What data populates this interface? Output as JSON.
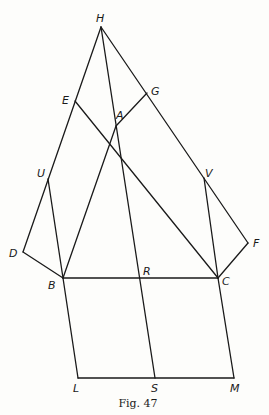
{
  "figure": {
    "caption": "Fig. 47",
    "points": {
      "H": {
        "label": "H",
        "x": 101,
        "y": 27,
        "lx": 96,
        "ly": 22
      },
      "E": {
        "label": "E",
        "x": 75,
        "y": 101,
        "lx": 62,
        "ly": 104
      },
      "G": {
        "label": "G",
        "x": 147,
        "y": 93,
        "lx": 151,
        "ly": 95
      },
      "A": {
        "label": "A",
        "x": 116,
        "y": 126,
        "lx": 116,
        "ly": 119
      },
      "U": {
        "label": "U",
        "x": 48,
        "y": 179,
        "lx": 37,
        "ly": 177
      },
      "V": {
        "label": "V",
        "x": 204,
        "y": 178,
        "lx": 205,
        "ly": 177
      },
      "D": {
        "label": "D",
        "x": 23,
        "y": 252,
        "lx": 9,
        "ly": 257
      },
      "F": {
        "label": "F",
        "x": 248,
        "y": 243,
        "lx": 253,
        "ly": 247
      },
      "B": {
        "label": "B",
        "x": 63,
        "y": 278,
        "lx": 48,
        "ly": 289
      },
      "R": {
        "label": "R",
        "x": 140,
        "y": 278,
        "lx": 143,
        "ly": 275
      },
      "C": {
        "label": "C",
        "x": 218,
        "y": 278,
        "lx": 222,
        "ly": 285
      },
      "L": {
        "label": "L",
        "x": 78,
        "y": 378,
        "lx": 73,
        "ly": 392
      },
      "S": {
        "label": "S",
        "x": 155,
        "y": 378,
        "lx": 151,
        "ly": 392
      },
      "M": {
        "label": "M",
        "x": 234,
        "y": 378,
        "lx": 230,
        "ly": 392
      }
    },
    "segments": [
      [
        "H",
        "D"
      ],
      [
        "H",
        "F"
      ],
      [
        "H",
        "S"
      ],
      [
        "E",
        "C"
      ],
      [
        "A",
        "G"
      ],
      [
        "A",
        "B"
      ],
      [
        "U",
        "B"
      ],
      [
        "V",
        "C"
      ],
      [
        "D",
        "B"
      ],
      [
        "F",
        "C"
      ],
      [
        "B",
        "C"
      ],
      [
        "B",
        "L"
      ],
      [
        "C",
        "M"
      ],
      [
        "L",
        "M"
      ]
    ]
  }
}
